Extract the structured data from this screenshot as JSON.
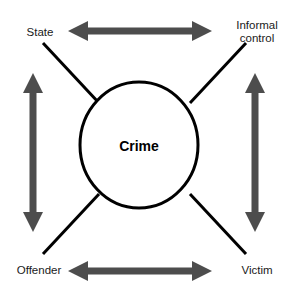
{
  "diagram": {
    "center": {
      "label": "Crime",
      "shape": "circle"
    },
    "nodes": [
      {
        "id": "state",
        "label": "State",
        "position": "top-left"
      },
      {
        "id": "informal-control",
        "label": "Informal\ncontrol",
        "position": "top-right"
      },
      {
        "id": "offender",
        "label": "Offender",
        "position": "bottom-left"
      },
      {
        "id": "victim",
        "label": "Victim",
        "position": "bottom-right"
      }
    ],
    "connectors": [
      {
        "id": "state-to-crime",
        "type": "line",
        "from": "state",
        "to": "center"
      },
      {
        "id": "informal-control-to-crime",
        "type": "line",
        "from": "informal-control",
        "to": "center"
      },
      {
        "id": "offender-to-crime",
        "type": "line",
        "from": "offender",
        "to": "center"
      },
      {
        "id": "victim-to-crime",
        "type": "line",
        "from": "victim",
        "to": "center"
      },
      {
        "id": "state-informal-control",
        "type": "double-arrow",
        "orientation": "horizontal",
        "from": "state",
        "to": "informal-control"
      },
      {
        "id": "offender-victim",
        "type": "double-arrow",
        "orientation": "horizontal",
        "from": "offender",
        "to": "victim"
      },
      {
        "id": "state-offender",
        "type": "double-arrow",
        "orientation": "vertical",
        "from": "state",
        "to": "offender"
      },
      {
        "id": "informal-control-victim",
        "type": "double-arrow",
        "orientation": "vertical",
        "from": "informal-control",
        "to": "victim"
      }
    ],
    "colors": {
      "arrow_fill": "#4d4d4d",
      "line_stroke": "#000000",
      "circle_stroke": "#000000",
      "background": "#ffffff",
      "label_text": "#1a1a1a",
      "center_text": "#000000"
    }
  }
}
